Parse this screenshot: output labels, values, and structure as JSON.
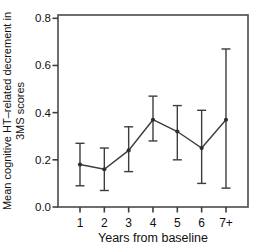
{
  "chart_data": {
    "type": "line",
    "subtype": "errorbar",
    "title": "",
    "categories": [
      "1",
      "2",
      "3",
      "4",
      "5",
      "6",
      "7+"
    ],
    "series": [
      {
        "name": "Mean cognitive HT-related decrement",
        "values": [
          0.18,
          0.16,
          0.24,
          0.37,
          0.32,
          0.25,
          0.37
        ],
        "ci_low": [
          0.09,
          0.07,
          0.15,
          0.28,
          0.2,
          0.1,
          0.08
        ],
        "ci_high": [
          0.27,
          0.25,
          0.34,
          0.47,
          0.43,
          0.41,
          0.67
        ]
      }
    ],
    "xlabel": "Years from baseline",
    "ylabel": "Mean cognitive HT–related decrement in 3MS scores",
    "ylabel_line1": "Mean cognitive HT–related decrement in",
    "ylabel_line2": "3MS scores",
    "ylim": [
      0,
      0.814
    ],
    "yticks": [
      0,
      0.2,
      0.4,
      0.6,
      0.8
    ],
    "ytick_labels": [
      "0.0",
      "0.2",
      "0.4",
      "0.6",
      "0.8"
    ],
    "grid": false,
    "legend": "none",
    "frame": "box",
    "marker": "filled-circle",
    "line_color": "#3d3d3d",
    "frame_color": "#555555",
    "tick_color": "#3f3f3f",
    "text_color": "#111111"
  }
}
